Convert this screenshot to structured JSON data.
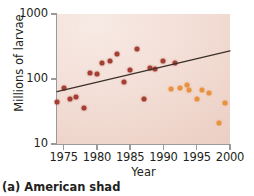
{
  "caption": "(a) American shad",
  "axes": {
    "y_title": "Millions of larvae",
    "x_title": "Year",
    "y_ticks": [
      "1000",
      "100",
      "10"
    ],
    "x_ticks": [
      "1975",
      "1980",
      "1985",
      "1990",
      "1995",
      "2000"
    ]
  },
  "colors": {
    "series_dark": "#a43f34",
    "series_light": "#e8913f",
    "plot_background": "#f1dcd3",
    "trend_line": "#3b2f2a",
    "axis": "#9a9a9a",
    "text": "#231f20"
  },
  "chart_data": {
    "type": "scatter",
    "title": "(a) American shad",
    "xlabel": "Year",
    "ylabel": "Millions of larvae",
    "xlim": [
      1974,
      2000
    ],
    "ylim": [
      10,
      1000
    ],
    "yscale": "log",
    "grid": false,
    "legend": "none",
    "series": [
      {
        "name": "Hatchery-released larvae (earlier period)",
        "color": "#a43f34",
        "points": [
          {
            "x": 1974.0,
            "y": 45
          },
          {
            "x": 1975.0,
            "y": 72
          },
          {
            "x": 1976.0,
            "y": 50
          },
          {
            "x": 1976.8,
            "y": 53
          },
          {
            "x": 1978.0,
            "y": 36
          },
          {
            "x": 1979.0,
            "y": 122
          },
          {
            "x": 1980.0,
            "y": 120
          },
          {
            "x": 1980.8,
            "y": 178
          },
          {
            "x": 1982.0,
            "y": 190
          },
          {
            "x": 1983.0,
            "y": 245
          },
          {
            "x": 1984.0,
            "y": 90
          },
          {
            "x": 1984.9,
            "y": 140
          },
          {
            "x": 1986.0,
            "y": 290
          },
          {
            "x": 1987.0,
            "y": 50
          },
          {
            "x": 1988.0,
            "y": 150
          },
          {
            "x": 1988.7,
            "y": 143
          },
          {
            "x": 1989.9,
            "y": 190
          },
          {
            "x": 1991.8,
            "y": 175
          }
        ]
      },
      {
        "name": "Hatchery-released larvae (later period)",
        "color": "#e8913f",
        "points": [
          {
            "x": 1991.2,
            "y": 70
          },
          {
            "x": 1992.5,
            "y": 72
          },
          {
            "x": 1993.6,
            "y": 82
          },
          {
            "x": 1993.9,
            "y": 68
          },
          {
            "x": 1995.0,
            "y": 50
          },
          {
            "x": 1995.8,
            "y": 68
          },
          {
            "x": 1996.9,
            "y": 60
          },
          {
            "x": 1998.4,
            "y": 21
          },
          {
            "x": 1999.3,
            "y": 43
          }
        ]
      }
    ],
    "trend_line": {
      "name": "regression line",
      "color": "#3b2f2a",
      "x_start": 1974.0,
      "y_start": 64,
      "x_end": 2000.0,
      "y_end": 270
    }
  }
}
